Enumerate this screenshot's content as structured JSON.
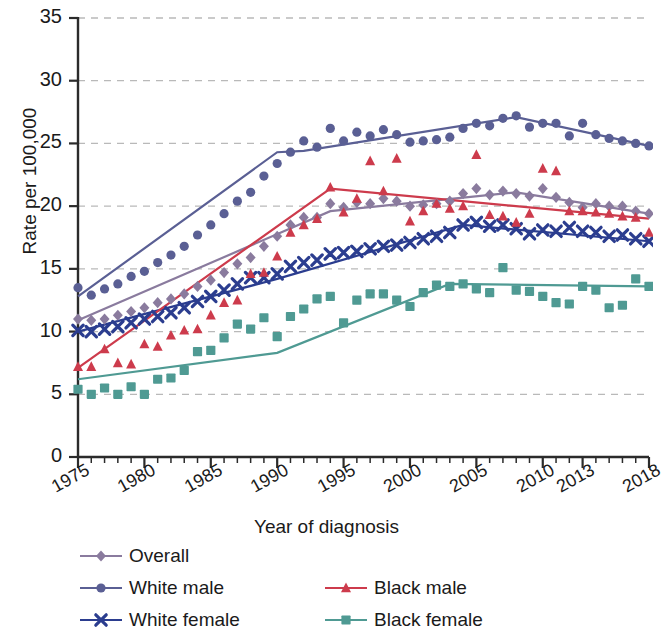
{
  "chart_data": {
    "type": "scatter",
    "title": "",
    "xlabel": "Year of diagnosis",
    "ylabel": "Rate per 100,000",
    "xlim": [
      1975,
      2018
    ],
    "ylim": [
      0,
      35
    ],
    "ytick_labels": [
      "0",
      "5",
      "10",
      "15",
      "20",
      "25",
      "30",
      "35"
    ],
    "ytick_values": [
      0,
      5,
      10,
      15,
      20,
      25,
      30,
      35
    ],
    "xtick_labels": [
      "1975",
      "1980",
      "1985",
      "1990",
      "1995",
      "2000",
      "2005",
      "2010",
      "2013",
      "2018"
    ],
    "xtick_values": [
      1975,
      1980,
      1985,
      1990,
      1995,
      2000,
      2005,
      2010,
      2013,
      2018
    ],
    "grid": "horizontal-dashed",
    "legend_position": "below",
    "x": [
      1975,
      1976,
      1977,
      1978,
      1979,
      1980,
      1981,
      1982,
      1983,
      1984,
      1985,
      1986,
      1987,
      1988,
      1989,
      1990,
      1991,
      1992,
      1993,
      1994,
      1995,
      1996,
      1997,
      1998,
      1999,
      2000,
      2001,
      2002,
      2003,
      2004,
      2005,
      2006,
      2007,
      2008,
      2009,
      2010,
      2011,
      2012,
      2013,
      2014,
      2015,
      2016,
      2017,
      2018
    ],
    "series": [
      {
        "name": "Overall",
        "marker": "diamond",
        "color": "#8a7b9e",
        "values": [
          11.0,
          10.9,
          11.0,
          11.3,
          11.6,
          11.9,
          12.3,
          12.6,
          13.0,
          13.6,
          14.1,
          14.7,
          15.4,
          15.9,
          16.8,
          17.6,
          18.5,
          19.1,
          19.1,
          20.2,
          19.9,
          20.3,
          20.2,
          20.6,
          20.4,
          20.0,
          20.1,
          20.2,
          20.4,
          21.0,
          21.4,
          20.9,
          21.2,
          21.0,
          20.8,
          21.4,
          20.7,
          20.3,
          19.9,
          20.2,
          20.0,
          20.0,
          19.6,
          19.4
        ],
        "trend": [
          [
            1975,
            10.9
          ],
          [
            1994,
            19.6
          ],
          [
            2008,
            21.1
          ],
          [
            2018,
            19.4
          ]
        ]
      },
      {
        "name": "White male",
        "marker": "circle",
        "color": "#5a5f94",
        "values": [
          13.5,
          12.9,
          13.4,
          13.8,
          14.4,
          14.8,
          15.5,
          16.1,
          16.8,
          17.7,
          18.5,
          19.4,
          20.4,
          21.1,
          22.4,
          23.4,
          24.3,
          25.2,
          24.7,
          26.2,
          25.2,
          25.9,
          25.6,
          26.1,
          25.7,
          25.1,
          25.2,
          25.3,
          25.5,
          26.2,
          26.6,
          26.4,
          27.0,
          27.2,
          26.3,
          26.6,
          26.6,
          25.6,
          26.6,
          25.7,
          25.4,
          25.2,
          25.0,
          24.8
        ],
        "trend": [
          [
            1975,
            12.8
          ],
          [
            1990,
            24.3
          ],
          [
            1992,
            24.4
          ],
          [
            2008,
            27.1
          ],
          [
            2018,
            24.8
          ]
        ]
      },
      {
        "name": "White female",
        "marker": "x",
        "color": "#2b3d8f",
        "values": [
          10.1,
          10.0,
          10.2,
          10.4,
          10.7,
          11.0,
          11.2,
          11.5,
          11.9,
          12.4,
          12.8,
          13.3,
          13.8,
          14.3,
          14.3,
          14.6,
          15.2,
          15.5,
          15.7,
          16.2,
          16.3,
          16.4,
          16.6,
          16.8,
          16.9,
          17.1,
          17.4,
          17.6,
          17.9,
          18.5,
          18.7,
          18.4,
          18.5,
          18.2,
          17.8,
          18.1,
          18.0,
          18.3,
          18.0,
          17.9,
          17.6,
          17.7,
          17.4,
          17.2
        ],
        "trend": [
          [
            1975,
            10.0
          ],
          [
            1990,
            14.2
          ],
          [
            2004,
            18.5
          ],
          [
            2018,
            17.2
          ]
        ]
      },
      {
        "name": "Black male",
        "marker": "triangle",
        "color": "#cd3b4c",
        "values": [
          7.2,
          7.2,
          8.6,
          7.5,
          7.4,
          9.0,
          8.8,
          9.7,
          10.1,
          10.2,
          11.3,
          12.3,
          12.5,
          14.6,
          14.7,
          16.0,
          17.9,
          18.5,
          19.0,
          21.5,
          19.5,
          20.6,
          23.6,
          21.2,
          23.8,
          18.8,
          19.6,
          20.2,
          19.8,
          20.0,
          24.1,
          19.3,
          19.2,
          18.7,
          19.4,
          23.0,
          22.8,
          19.6,
          19.6,
          19.5,
          19.4,
          19.2,
          19.1,
          17.9
        ],
        "trend": [
          [
            1975,
            7.1
          ],
          [
            1994,
            21.4
          ],
          [
            2018,
            19.0
          ]
        ]
      },
      {
        "name": "Black female",
        "marker": "square",
        "color": "#4f9a93",
        "values": [
          5.4,
          5.0,
          5.5,
          5.0,
          5.6,
          5.0,
          6.2,
          6.3,
          6.9,
          8.4,
          8.5,
          9.5,
          10.6,
          10.2,
          11.1,
          9.6,
          11.2,
          11.8,
          12.6,
          12.8,
          10.7,
          12.5,
          13.0,
          13.0,
          12.5,
          12.0,
          13.1,
          13.7,
          13.6,
          13.8,
          13.4,
          13.1,
          15.1,
          13.3,
          13.2,
          12.8,
          12.3,
          12.2,
          13.6,
          13.3,
          11.9,
          12.1,
          14.2,
          13.6
        ],
        "trend": [
          [
            1975,
            6.2
          ],
          [
            1990,
            8.3
          ],
          [
            2003,
            13.8
          ],
          [
            2018,
            13.6
          ]
        ]
      }
    ]
  },
  "legend": {
    "rows": [
      [
        {
          "name": "Overall",
          "marker": "diamond",
          "color": "#8a7b9e"
        }
      ],
      [
        {
          "name": "White male",
          "marker": "circle",
          "color": "#5a5f94"
        },
        {
          "name": "Black male",
          "marker": "triangle",
          "color": "#cd3b4c"
        }
      ],
      [
        {
          "name": "White female",
          "marker": "x",
          "color": "#2b3d8f"
        },
        {
          "name": "Black female",
          "marker": "square",
          "color": "#4f9a93"
        }
      ]
    ]
  },
  "axes": {
    "ylabel": "Rate per 100,000",
    "xlabel": "Year of diagnosis"
  }
}
